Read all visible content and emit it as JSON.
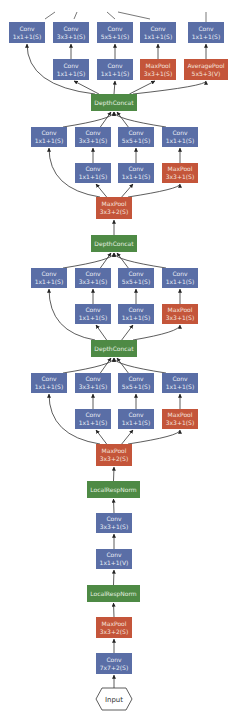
{
  "colors": {
    "conv": "#5a6ea6",
    "pool": "#c4553a",
    "concat": "#4e8a45",
    "edge": "#333333"
  },
  "nodes": [
    {
      "id": "b5_c1",
      "type": "conv",
      "l1": "Conv",
      "l2": "1x1+1(S)",
      "x": 9,
      "y": 22,
      "w": 36,
      "h": 21
    },
    {
      "id": "b5_c3",
      "type": "conv",
      "l1": "Conv",
      "l2": "3x3+1(S)",
      "x": 53,
      "y": 22,
      "w": 36,
      "h": 21
    },
    {
      "id": "b5_c5",
      "type": "conv",
      "l1": "Conv",
      "l2": "5x5+1(S)",
      "x": 97,
      "y": 22,
      "w": 36,
      "h": 21
    },
    {
      "id": "b5_cp",
      "type": "conv",
      "l1": "Conv",
      "l2": "1x1+1(S)",
      "x": 140,
      "y": 22,
      "w": 36,
      "h": 21
    },
    {
      "id": "b5_ca",
      "type": "conv",
      "l1": "Conv",
      "l2": "1x1+1(S)",
      "x": 188,
      "y": 22,
      "w": 36,
      "h": 21
    },
    {
      "id": "b5_r3",
      "type": "conv",
      "l1": "Conv",
      "l2": "1x1+1(S)",
      "x": 53,
      "y": 59,
      "w": 36,
      "h": 21
    },
    {
      "id": "b5_r5",
      "type": "conv",
      "l1": "Conv",
      "l2": "1x1+1(S)",
      "x": 97,
      "y": 59,
      "w": 36,
      "h": 21
    },
    {
      "id": "b5_mp",
      "type": "pool",
      "l1": "MaxPool",
      "l2": "3x3+1(S)",
      "x": 140,
      "y": 59,
      "w": 36,
      "h": 21
    },
    {
      "id": "b5_ap",
      "type": "pool",
      "l1": "AveragePool",
      "l2": "5x5+3(V)",
      "x": 184,
      "y": 59,
      "w": 44,
      "h": 21
    },
    {
      "id": "dc3",
      "type": "concat",
      "l1": "DepthConcat",
      "l2": "",
      "x": 91,
      "y": 94,
      "w": 46,
      "h": 17
    },
    {
      "id": "b4_c1",
      "type": "conv",
      "l1": "Conv",
      "l2": "1x1+1(S)",
      "x": 31,
      "y": 127,
      "w": 36,
      "h": 20
    },
    {
      "id": "b4_c3",
      "type": "conv",
      "l1": "Conv",
      "l2": "3x3+1(S)",
      "x": 75,
      "y": 127,
      "w": 36,
      "h": 20
    },
    {
      "id": "b4_c5",
      "type": "conv",
      "l1": "Conv",
      "l2": "5x5+1(S)",
      "x": 118,
      "y": 127,
      "w": 36,
      "h": 20
    },
    {
      "id": "b4_cp",
      "type": "conv",
      "l1": "Conv",
      "l2": "1x1+1(S)",
      "x": 162,
      "y": 127,
      "w": 36,
      "h": 20
    },
    {
      "id": "b4_r3",
      "type": "conv",
      "l1": "Conv",
      "l2": "1x1+1(S)",
      "x": 75,
      "y": 163,
      "w": 36,
      "h": 20
    },
    {
      "id": "b4_r5",
      "type": "conv",
      "l1": "Conv",
      "l2": "1x1+1(S)",
      "x": 118,
      "y": 163,
      "w": 36,
      "h": 20
    },
    {
      "id": "b4_mp",
      "type": "pool",
      "l1": "MaxPool",
      "l2": "3x3+1(S)",
      "x": 162,
      "y": 163,
      "w": 36,
      "h": 20
    },
    {
      "id": "mp3",
      "type": "pool",
      "l1": "MaxPool",
      "l2": "3x3+2(S)",
      "x": 96,
      "y": 197,
      "w": 36,
      "h": 22
    },
    {
      "id": "dc2",
      "type": "concat",
      "l1": "DepthConcat",
      "l2": "",
      "x": 91,
      "y": 235,
      "w": 46,
      "h": 17
    },
    {
      "id": "b3_c1",
      "type": "conv",
      "l1": "Conv",
      "l2": "1x1+1(S)",
      "x": 31,
      "y": 268,
      "w": 36,
      "h": 20
    },
    {
      "id": "b3_c3",
      "type": "conv",
      "l1": "Conv",
      "l2": "3x3+1(S)",
      "x": 75,
      "y": 268,
      "w": 36,
      "h": 20
    },
    {
      "id": "b3_c5",
      "type": "conv",
      "l1": "Conv",
      "l2": "5x5+1(S)",
      "x": 118,
      "y": 268,
      "w": 36,
      "h": 20
    },
    {
      "id": "b3_cp",
      "type": "conv",
      "l1": "Conv",
      "l2": "1x1+1(S)",
      "x": 162,
      "y": 268,
      "w": 36,
      "h": 20
    },
    {
      "id": "b3_r3",
      "type": "conv",
      "l1": "Conv",
      "l2": "1x1+1(S)",
      "x": 75,
      "y": 304,
      "w": 36,
      "h": 20
    },
    {
      "id": "b3_r5",
      "type": "conv",
      "l1": "Conv",
      "l2": "1x1+1(S)",
      "x": 118,
      "y": 304,
      "w": 36,
      "h": 20
    },
    {
      "id": "b3_mp",
      "type": "pool",
      "l1": "MaxPool",
      "l2": "3x3+1(S)",
      "x": 162,
      "y": 304,
      "w": 36,
      "h": 20
    },
    {
      "id": "dc1",
      "type": "concat",
      "l1": "DepthConcat",
      "l2": "",
      "x": 91,
      "y": 340,
      "w": 46,
      "h": 17
    },
    {
      "id": "b2_c1",
      "type": "conv",
      "l1": "Conv",
      "l2": "1x1+1(S)",
      "x": 31,
      "y": 373,
      "w": 36,
      "h": 20
    },
    {
      "id": "b2_c3",
      "type": "conv",
      "l1": "Conv",
      "l2": "3x3+1(S)",
      "x": 75,
      "y": 373,
      "w": 36,
      "h": 20
    },
    {
      "id": "b2_c5",
      "type": "conv",
      "l1": "Conv",
      "l2": "5x5+1(S)",
      "x": 118,
      "y": 373,
      "w": 36,
      "h": 20
    },
    {
      "id": "b2_cp",
      "type": "conv",
      "l1": "Conv",
      "l2": "1x1+1(S)",
      "x": 162,
      "y": 373,
      "w": 36,
      "h": 20
    },
    {
      "id": "b2_r3",
      "type": "conv",
      "l1": "Conv",
      "l2": "1x1+1(S)",
      "x": 75,
      "y": 409,
      "w": 36,
      "h": 20
    },
    {
      "id": "b2_r5",
      "type": "conv",
      "l1": "Conv",
      "l2": "1x1+1(S)",
      "x": 118,
      "y": 409,
      "w": 36,
      "h": 20
    },
    {
      "id": "b2_mp",
      "type": "pool",
      "l1": "MaxPool",
      "l2": "3x3+1(S)",
      "x": 162,
      "y": 409,
      "w": 36,
      "h": 20
    },
    {
      "id": "mp2",
      "type": "pool",
      "l1": "MaxPool",
      "l2": "3x3+2(S)",
      "x": 96,
      "y": 444,
      "w": 36,
      "h": 22
    },
    {
      "id": "lrn2",
      "type": "norm",
      "l1": "LocalRespNorm",
      "l2": "",
      "x": 87,
      "y": 481,
      "w": 53,
      "h": 17
    },
    {
      "id": "conv3",
      "type": "conv",
      "l1": "Conv",
      "l2": "3x3+1(S)",
      "x": 96,
      "y": 513,
      "w": 36,
      "h": 20
    },
    {
      "id": "conv2",
      "type": "conv",
      "l1": "Conv",
      "l2": "1x1+1(V)",
      "x": 96,
      "y": 549,
      "w": 36,
      "h": 20
    },
    {
      "id": "lrn1",
      "type": "norm",
      "l1": "LocalRespNorm",
      "l2": "",
      "x": 87,
      "y": 585,
      "w": 53,
      "h": 17
    },
    {
      "id": "mp1",
      "type": "pool",
      "l1": "MaxPool",
      "l2": "3x3+2(S)",
      "x": 96,
      "y": 617,
      "w": 36,
      "h": 21
    },
    {
      "id": "conv1",
      "type": "conv",
      "l1": "Conv",
      "l2": "7x7+2(S)",
      "x": 96,
      "y": 653,
      "w": 36,
      "h": 21
    },
    {
      "id": "input",
      "type": "input",
      "l1": "Input",
      "l2": "",
      "x": 96,
      "y": 688,
      "w": 36,
      "h": 22
    }
  ],
  "edges": [
    [
      "input",
      "conv1"
    ],
    [
      "conv1",
      "mp1"
    ],
    [
      "mp1",
      "lrn1"
    ],
    [
      "lrn1",
      "conv2"
    ],
    [
      "conv2",
      "conv3"
    ],
    [
      "conv3",
      "lrn2"
    ],
    [
      "lrn2",
      "mp2"
    ],
    [
      "mp2",
      "b2_c1"
    ],
    [
      "mp2",
      "b2_r3"
    ],
    [
      "mp2",
      "b2_r5"
    ],
    [
      "mp2",
      "b2_mp"
    ],
    [
      "b2_r3",
      "b2_c3"
    ],
    [
      "b2_r5",
      "b2_c5"
    ],
    [
      "b2_mp",
      "b2_cp"
    ],
    [
      "b2_c1",
      "dc1"
    ],
    [
      "b2_c3",
      "dc1"
    ],
    [
      "b2_c5",
      "dc1"
    ],
    [
      "b2_cp",
      "dc1"
    ],
    [
      "dc1",
      "b3_c1"
    ],
    [
      "dc1",
      "b3_r3"
    ],
    [
      "dc1",
      "b3_r5"
    ],
    [
      "dc1",
      "b3_mp"
    ],
    [
      "b3_r3",
      "b3_c3"
    ],
    [
      "b3_r5",
      "b3_c5"
    ],
    [
      "b3_mp",
      "b3_cp"
    ],
    [
      "b3_c1",
      "dc2"
    ],
    [
      "b3_c3",
      "dc2"
    ],
    [
      "b3_c5",
      "dc2"
    ],
    [
      "b3_cp",
      "dc2"
    ],
    [
      "dc2",
      "mp3"
    ],
    [
      "mp3",
      "b4_c1"
    ],
    [
      "mp3",
      "b4_r3"
    ],
    [
      "mp3",
      "b4_r5"
    ],
    [
      "mp3",
      "b4_mp"
    ],
    [
      "b4_r3",
      "b4_c3"
    ],
    [
      "b4_r5",
      "b4_c5"
    ],
    [
      "b4_mp",
      "b4_cp"
    ],
    [
      "b4_c1",
      "dc3"
    ],
    [
      "b4_c3",
      "dc3"
    ],
    [
      "b4_c5",
      "dc3"
    ],
    [
      "b4_cp",
      "dc3"
    ],
    [
      "dc3",
      "b5_c1"
    ],
    [
      "dc3",
      "b5_r3"
    ],
    [
      "dc3",
      "b5_r5"
    ],
    [
      "dc3",
      "b5_mp"
    ],
    [
      "dc3",
      "b5_ap"
    ],
    [
      "b5_r3",
      "b5_c3"
    ],
    [
      "b5_r5",
      "b5_c5"
    ],
    [
      "b5_mp",
      "b5_cp"
    ],
    [
      "b5_ap",
      "b5_ca"
    ]
  ],
  "top_stubs": [
    [
      45,
      19,
      55,
      12
    ],
    [
      74,
      19,
      77,
      12
    ],
    [
      115,
      19,
      107,
      12
    ],
    [
      150,
      19,
      118,
      12
    ],
    [
      206,
      22,
      206,
      12
    ]
  ]
}
